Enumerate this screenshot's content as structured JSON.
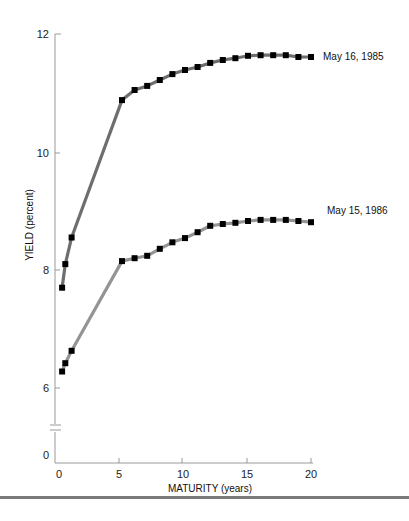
{
  "chart_data": {
    "type": "line",
    "title": "",
    "xlabel": "MATURITY (years)",
    "ylabel": "YIELD (percent)",
    "xlim": [
      0,
      20
    ],
    "ylim": [
      0,
      12
    ],
    "y_axis_break": true,
    "x_ticks": [
      0,
      5,
      10,
      15,
      20
    ],
    "y_ticks": [
      0,
      6,
      8,
      10,
      12
    ],
    "grid": false,
    "legend_position": "inline-right",
    "series": [
      {
        "name": "May 16, 1985",
        "line_color": "#6e6e6e",
        "marker": "square",
        "points": [
          [
            0.25,
            7.7
          ],
          [
            0.5,
            8.1
          ],
          [
            1,
            8.55
          ],
          [
            5,
            10.88
          ],
          [
            6,
            11.05
          ],
          [
            7,
            11.12
          ],
          [
            8,
            11.22
          ],
          [
            9,
            11.32
          ],
          [
            10,
            11.39
          ],
          [
            11,
            11.44
          ],
          [
            12,
            11.51
          ],
          [
            13,
            11.56
          ],
          [
            14,
            11.59
          ],
          [
            15,
            11.63
          ],
          [
            16,
            11.64
          ],
          [
            17,
            11.64
          ],
          [
            18,
            11.64
          ],
          [
            19,
            11.61
          ],
          [
            20,
            11.61
          ]
        ]
      },
      {
        "name": "May 15, 1986",
        "line_color": "#949494",
        "marker": "square",
        "points": [
          [
            0.25,
            6.28
          ],
          [
            0.5,
            6.42
          ],
          [
            1,
            6.63
          ],
          [
            5,
            8.15
          ],
          [
            6,
            8.2
          ],
          [
            7,
            8.24
          ],
          [
            8,
            8.36
          ],
          [
            9,
            8.47
          ],
          [
            10,
            8.54
          ],
          [
            11,
            8.64
          ],
          [
            12,
            8.75
          ],
          [
            13,
            8.78
          ],
          [
            14,
            8.8
          ],
          [
            15,
            8.83
          ],
          [
            16,
            8.85
          ],
          [
            17,
            8.85
          ],
          [
            18,
            8.85
          ],
          [
            19,
            8.83
          ],
          [
            20,
            8.81
          ]
        ]
      }
    ]
  },
  "labels": {
    "ylabel": "YIELD (percent)",
    "xlabel": "MATURITY (years)",
    "series_1": "May 16, 1985",
    "series_2": "May 15, 1986",
    "y_ticks": [
      "12",
      "10",
      "8",
      "6",
      "0"
    ],
    "x_ticks": [
      "0",
      "5",
      "10",
      "15",
      "20"
    ]
  },
  "colors": {
    "axis": "#9a9a9a",
    "marker": "#000000",
    "rule": "#7a7a7a"
  }
}
